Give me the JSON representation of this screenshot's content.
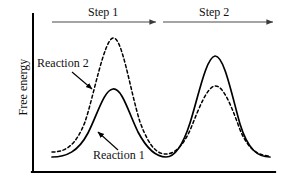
{
  "figure": {
    "kind": "free-energy-reaction-coordinate-diagram",
    "axes": {
      "y_label": "Free energy",
      "x_label": "",
      "y_axis_x": 33,
      "y_axis_top": 14,
      "x_axis_y": 172,
      "x_axis_left": 33,
      "x_axis_right": 275,
      "axis_color": "#000000",
      "axis_width": 2
    },
    "steps": [
      {
        "label": "Step 1",
        "arrow_y": 22,
        "arrow_x1": 52,
        "arrow_x2": 158,
        "label_x": 88,
        "label_y": 6
      },
      {
        "label": "Step 2",
        "arrow_y": 22,
        "arrow_x1": 163,
        "arrow_x2": 275,
        "label_x": 199,
        "label_y": 6
      }
    ],
    "annotations": [
      {
        "text": "Reaction 2",
        "label_x": 37,
        "label_y": 57,
        "arrow_from_x": 72,
        "arrow_from_y": 72,
        "arrow_to_x": 93,
        "arrow_to_y": 90
      },
      {
        "text": "Reaction 1",
        "label_x": 93,
        "label_y": 149,
        "arrow_from_x": 118,
        "arrow_from_y": 150,
        "arrow_to_x": 97,
        "arrow_to_y": 132
      }
    ],
    "curve_color": "#000000",
    "curve_width": 1.6,
    "dash_pattern": "3,2.6"
  },
  "chart_data": {
    "type": "line",
    "title": "",
    "xlabel": "",
    "ylabel": "Free energy",
    "grid": false,
    "legend": "inline-annotations",
    "xlim": [
      33,
      275
    ],
    "ylim": [
      172,
      14
    ],
    "annotations": [
      "Step 1",
      "Step 2",
      "Reaction 1",
      "Reaction 2"
    ],
    "series": [
      {
        "name": "Reaction 1",
        "style": "solid",
        "path": "M 52,157 C 66,157 78,152 88,133 C 98,113 104,90 113,89 C 122,88 128,111 138,132 C 148,151 158,157 166,157 C 174,157 182,148 190,123 C 198,98 206,57 215,56 C 224,55 232,96 240,124 C 248,150 258,157 270,157",
        "features": {
          "start_y": 157,
          "peak1": {
            "x": 113,
            "y": 89
          },
          "valley": {
            "x": 166,
            "y": 157
          },
          "peak2": {
            "x": 215,
            "y": 56
          },
          "end_y": 157
        }
      },
      {
        "name": "Reaction 2",
        "style": "dashed",
        "path": "M 52,152 C 66,152 76,145 85,122 C 94,95 104,40 113,38 C 122,36 130,90 140,122 C 150,149 158,154 166,154 C 174,154 183,147 191,128 C 199,108 207,87 215,86 C 223,85 231,105 239,127 C 247,149 258,156 270,156",
        "features": {
          "start_y": 152,
          "peak1": {
            "x": 113,
            "y": 38
          },
          "valley": {
            "x": 166,
            "y": 154
          },
          "peak2": {
            "x": 215,
            "y": 86
          },
          "end_y": 156
        }
      }
    ]
  }
}
